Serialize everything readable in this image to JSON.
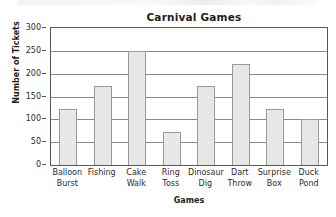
{
  "chart_data": {
    "type": "bar",
    "title": "Carnival Games",
    "xlabel": "Games",
    "ylabel": "Number of Tickets",
    "categories": [
      "Balloon Burst",
      "Fishing",
      "Cake Walk",
      "Ring Toss",
      "Dinosaur Dig",
      "Dart Throw",
      "Surprise Box",
      "Duck Pond"
    ],
    "category_lines": [
      [
        "Balloon",
        "Burst"
      ],
      [
        "Fishing",
        ""
      ],
      [
        "Cake",
        "Walk"
      ],
      [
        "Ring",
        "Toss"
      ],
      [
        "Dinosaur",
        "Dig"
      ],
      [
        "Dart",
        "Throw"
      ],
      [
        "Surprise",
        "Box"
      ],
      [
        "Duck",
        "Pond"
      ]
    ],
    "values": [
      123,
      172,
      250,
      72,
      172,
      222,
      123,
      100
    ],
    "ylim": [
      0,
      300
    ],
    "yticks": [
      0,
      50,
      100,
      150,
      200,
      250,
      300
    ],
    "ytick_labels": [
      "0",
      "50",
      "100",
      "150",
      "200",
      "250",
      "300"
    ],
    "grid": "horizontal",
    "legend": "none",
    "bar_fill": "#e7e7e5",
    "bar_border": "#9a9a98",
    "gridline_color": "#8a8a8a",
    "axis_color": "#595959"
  }
}
